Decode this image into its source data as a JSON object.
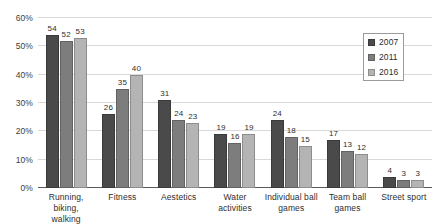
{
  "chart_data": {
    "type": "bar",
    "title": "",
    "subtitle": "",
    "xlabel": "",
    "ylabel": "",
    "ylim": [
      0,
      60
    ],
    "y_tick_labels": [
      "0%",
      "10%",
      "20%",
      "30%",
      "40%",
      "50%",
      "60%"
    ],
    "y_tick_values": [
      0,
      10,
      20,
      30,
      40,
      50,
      60
    ],
    "grid": true,
    "legend_position": "top-right",
    "value_labels": true,
    "categories": [
      "Running, biking, walking",
      "Fitness",
      "Aestetics",
      "Water activities",
      "Individual ball games",
      "Team ball games",
      "Street sport"
    ],
    "category_lines": [
      [
        "Running,",
        "biking, walking"
      ],
      [
        "Fitness"
      ],
      [
        "Aestetics"
      ],
      [
        "Water",
        "activities"
      ],
      [
        "Individual ball",
        "games"
      ],
      [
        "Team ball",
        "games"
      ],
      [
        "Street sport"
      ]
    ],
    "series": [
      {
        "name": "2007",
        "color": "#4a4a4a",
        "values": [
          54,
          52,
          31,
          19,
          24,
          17,
          4
        ]
      },
      {
        "name": "2011",
        "color": "#7d7d7d",
        "values": [
          52,
          35,
          24,
          16,
          18,
          13,
          3
        ]
      },
      {
        "name": "2016",
        "color": "#b4b4b4",
        "values": [
          53,
          40,
          23,
          19,
          15,
          12,
          3
        ]
      }
    ],
    "grouped_values": [
      {
        "category": "Running, biking, walking",
        "2007": 54,
        "2011": 52,
        "2016": 53
      },
      {
        "category": "Fitness",
        "2007": 26,
        "2011": 35,
        "2016": 40
      },
      {
        "category": "Aestetics",
        "2007": 31,
        "2011": 24,
        "2016": 23
      },
      {
        "category": "Water activities",
        "2007": 19,
        "2011": 16,
        "2016": 19
      },
      {
        "category": "Individual ball games",
        "2007": 24,
        "2011": 18,
        "2016": 15
      },
      {
        "category": "Team ball games",
        "2007": 17,
        "2011": 13,
        "2016": 12
      },
      {
        "category": "Street sport",
        "2007": 4,
        "2011": 3,
        "2016": 3
      }
    ]
  },
  "legend": {
    "items": [
      {
        "label": "2007",
        "color": "#4a4a4a"
      },
      {
        "label": "2011",
        "color": "#7d7d7d"
      },
      {
        "label": "2016",
        "color": "#b4b4b4"
      }
    ]
  },
  "colors": {
    "series_2007": "#4a4a4a",
    "series_2011": "#7d7d7d",
    "series_2016": "#b4b4b4",
    "gridline": "#d9d9d9",
    "baseline": "#5a5a5a",
    "text": "#2e2e2e",
    "background": "#ffffff"
  }
}
